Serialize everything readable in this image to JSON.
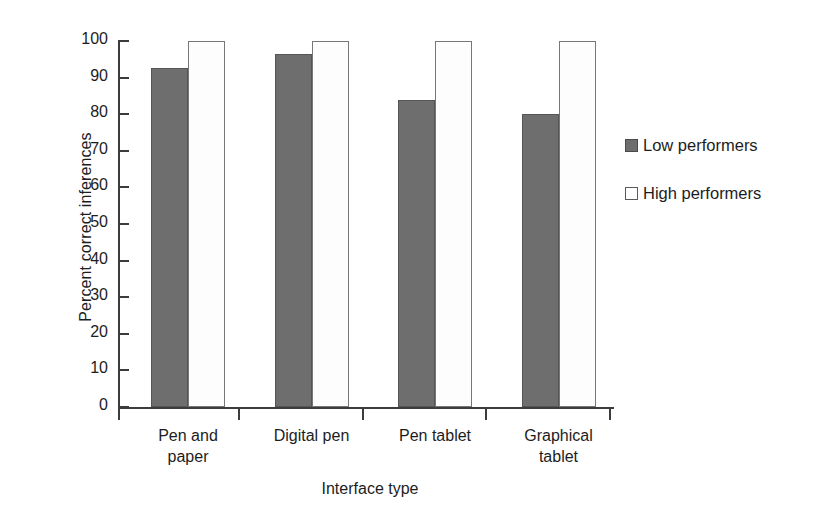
{
  "chart_data": {
    "type": "bar",
    "title": "",
    "xlabel": "Interface type",
    "ylabel": "Percent correct inferences",
    "categories": [
      "Pen and paper",
      "Digital pen",
      "Pen tablet",
      "Graphical tablet"
    ],
    "category_lines": [
      [
        "Pen and",
        "paper"
      ],
      [
        "Digital pen",
        ""
      ],
      [
        "Pen tablet",
        ""
      ],
      [
        "Graphical",
        "tablet"
      ]
    ],
    "series": [
      {
        "name": "Low performers",
        "values": [
          92.5,
          96.5,
          84,
          80
        ],
        "color": "#6e6e6e",
        "border": "#555555"
      },
      {
        "name": "High performers",
        "values": [
          100,
          100,
          100,
          100
        ],
        "color": "#fdfdfd",
        "border": "#777777"
      }
    ],
    "ylim": [
      0,
      100
    ],
    "yticks": [
      0,
      10,
      20,
      30,
      40,
      50,
      60,
      70,
      80,
      90,
      100
    ],
    "ytick_labels": [
      "0",
      "10",
      "20",
      "30",
      "40",
      "50",
      "60",
      "70",
      "80",
      "90",
      "100"
    ],
    "grid": false,
    "legend_position": "right",
    "axis_color": "#3c3c3c",
    "background": "#ffffff"
  },
  "legend": {
    "items": [
      {
        "label": "Low performers",
        "style": "low"
      },
      {
        "label": "High performers",
        "style": "high"
      }
    ]
  }
}
